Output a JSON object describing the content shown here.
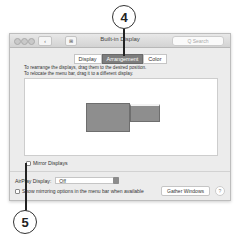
{
  "callouts": [
    {
      "number": "4"
    },
    {
      "number": "5"
    }
  ],
  "window": {
    "title": "Built-in Display",
    "nav_back": "‹",
    "nav_grid": "⊞",
    "search_placeholder": "Q Search",
    "tabs": [
      {
        "label": "Display",
        "active": false
      },
      {
        "label": "Arrangement",
        "active": true
      },
      {
        "label": "Color",
        "active": false
      }
    ],
    "instructions": [
      "To rearrange the displays, drag them to the desired position.",
      "To relocate the menu bar, drag it to a different display."
    ],
    "mirror_displays_label": "Mirror Displays",
    "airplay_label": "AirPlay Display:",
    "airplay_value": "Off",
    "show_mirroring_label": "Show mirroring options in the menu bar when available",
    "gather_windows_label": "Gather Windows",
    "help_label": "?"
  }
}
